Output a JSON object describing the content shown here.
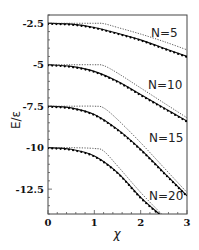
{
  "chart_data": {
    "type": "line",
    "title": "",
    "xlabel": "χ",
    "ylabel": "E/ε",
    "xlim": [
      0,
      3
    ],
    "ylim": [
      -14,
      -2
    ],
    "xticks": [
      "0",
      "1",
      "2",
      "3"
    ],
    "yticks": [
      "-2.5",
      "-5",
      "-7.5",
      "-10",
      "-12.5"
    ],
    "grid": false,
    "legend": "none (curves labeled inline)",
    "annotations": [
      "N=5",
      "N=10",
      "N=15",
      "N=20"
    ],
    "series": [
      {
        "name": "N=5 (solid + markers)",
        "style": "solid-with-dots",
        "x": [
          0,
          0.5,
          1.0,
          1.5,
          2.0,
          2.5,
          3.0
        ],
        "y": [
          -2.5,
          -2.55,
          -2.75,
          -3.1,
          -3.5,
          -4.0,
          -4.5
        ]
      },
      {
        "name": "N=5 (dotted)",
        "style": "dotted",
        "x": [
          0,
          0.5,
          1.0,
          1.2,
          1.5,
          2.0,
          2.5,
          3.0
        ],
        "y": [
          -2.5,
          -2.5,
          -2.5,
          -2.52,
          -2.75,
          -3.15,
          -3.6,
          -4.1
        ]
      },
      {
        "name": "N=10 (solid + markers)",
        "style": "solid-with-dots",
        "x": [
          0,
          0.5,
          1.0,
          1.5,
          2.0,
          2.5,
          3.0
        ],
        "y": [
          -5.0,
          -5.1,
          -5.4,
          -6.0,
          -6.8,
          -7.6,
          -8.4
        ]
      },
      {
        "name": "N=10 (dotted)",
        "style": "dotted",
        "x": [
          0,
          0.5,
          1.0,
          1.2,
          1.5,
          2.0,
          2.5,
          3.0
        ],
        "y": [
          -5.0,
          -5.0,
          -5.0,
          -5.05,
          -5.5,
          -6.4,
          -7.3,
          -8.2
        ]
      },
      {
        "name": "N=15 (solid + markers)",
        "style": "solid-with-dots",
        "x": [
          0,
          0.5,
          1.0,
          1.5,
          2.0,
          2.5,
          3.0
        ],
        "y": [
          -7.5,
          -7.6,
          -8.0,
          -8.9,
          -10.1,
          -11.5,
          -12.9
        ]
      },
      {
        "name": "N=15 (dotted)",
        "style": "dotted",
        "x": [
          0,
          0.5,
          1.0,
          1.2,
          1.5,
          2.0,
          2.5,
          3.0
        ],
        "y": [
          -7.5,
          -7.5,
          -7.5,
          -7.6,
          -8.3,
          -9.7,
          -11.2,
          -12.7
        ]
      },
      {
        "name": "N=20 (solid + markers)",
        "style": "solid-with-dots",
        "x": [
          0,
          0.5,
          1.0,
          1.5,
          2.0,
          2.4
        ],
        "y": [
          -10.0,
          -10.1,
          -10.5,
          -11.5,
          -13.0,
          -14.0
        ]
      },
      {
        "name": "N=20 (dotted)",
        "style": "dotted",
        "x": [
          0,
          0.5,
          1.0,
          1.2,
          1.5,
          2.0,
          2.45
        ],
        "y": [
          -10.0,
          -10.0,
          -10.05,
          -10.2,
          -11.1,
          -12.7,
          -14.0
        ]
      }
    ]
  },
  "axes": {
    "x_title": "χ",
    "y_title": "E/ε"
  },
  "labels": {
    "n5": "N=5",
    "n10": "N=10",
    "n15": "N=15",
    "n20": "N=20"
  }
}
